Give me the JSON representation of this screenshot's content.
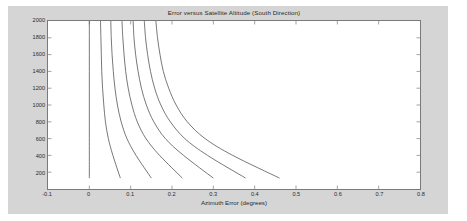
{
  "figure": {
    "background_color": "#d5d5d5",
    "axes_background_color": "#ffffff",
    "axes_border_color": "#7a7a7a",
    "line_color": "#555555"
  },
  "chart_data": {
    "type": "line",
    "title": "Error versus Satellite Altitude (South Direction)",
    "xlabel": "Azimuth Error (degrees)",
    "ylabel": "Satellite Altitude (km)",
    "xlim": [
      -0.1,
      0.8
    ],
    "ylim": [
      0,
      2000
    ],
    "xticks": [
      -0.1,
      0,
      0.1,
      0.2,
      0.3,
      0.4,
      0.5,
      0.6,
      0.7,
      0.8
    ],
    "xtick_labels": [
      "-0.1",
      "0",
      "0.1",
      "0.2",
      "0.3",
      "0.4",
      "0.5",
      "0.6",
      "0.7",
      "0.8"
    ],
    "yticks": [
      200,
      400,
      600,
      800,
      1000,
      1200,
      1400,
      1600,
      1800,
      2000
    ],
    "ytick_labels": [
      "200",
      "400",
      "600",
      "800",
      "1000",
      "1200",
      "1400",
      "1600",
      "1800",
      "2000"
    ],
    "grid": false,
    "legend": null,
    "series": [
      {
        "name": "curve-1",
        "x": [
          0.0,
          0.0,
          0.0,
          0.0,
          0.0,
          0.0,
          0.0,
          0.0,
          0.0,
          0.0
        ],
        "y": [
          2000,
          1800,
          1600,
          1400,
          1200,
          1000,
          800,
          600,
          400,
          130
        ]
      },
      {
        "name": "curve-2",
        "x": [
          0.027,
          0.028,
          0.029,
          0.03,
          0.032,
          0.035,
          0.039,
          0.046,
          0.057,
          0.075
        ],
        "y": [
          2000,
          1800,
          1600,
          1400,
          1200,
          1000,
          800,
          600,
          400,
          130
        ]
      },
      {
        "name": "curve-3",
        "x": [
          0.052,
          0.053,
          0.055,
          0.058,
          0.062,
          0.068,
          0.077,
          0.091,
          0.113,
          0.15
        ],
        "y": [
          2000,
          1800,
          1600,
          1400,
          1200,
          1000,
          800,
          600,
          400,
          130
        ]
      },
      {
        "name": "curve-4",
        "x": [
          0.079,
          0.081,
          0.084,
          0.088,
          0.094,
          0.103,
          0.116,
          0.137,
          0.17,
          0.225
        ],
        "y": [
          2000,
          1800,
          1600,
          1400,
          1200,
          1000,
          800,
          600,
          400,
          130
        ]
      },
      {
        "name": "curve-5",
        "x": [
          0.106,
          0.108,
          0.112,
          0.118,
          0.126,
          0.138,
          0.156,
          0.184,
          0.228,
          0.3
        ],
        "y": [
          2000,
          1800,
          1600,
          1400,
          1200,
          1000,
          800,
          600,
          400,
          130
        ]
      },
      {
        "name": "curve-6",
        "x": [
          0.133,
          0.136,
          0.141,
          0.148,
          0.158,
          0.173,
          0.196,
          0.231,
          0.286,
          0.378
        ],
        "y": [
          2000,
          1800,
          1600,
          1400,
          1200,
          1000,
          800,
          600,
          400,
          130
        ]
      },
      {
        "name": "curve-7",
        "x": [
          0.161,
          0.165,
          0.171,
          0.179,
          0.192,
          0.21,
          0.237,
          0.28,
          0.347,
          0.46
        ],
        "y": [
          2000,
          1800,
          1600,
          1400,
          1200,
          1000,
          800,
          600,
          400,
          130
        ]
      }
    ]
  }
}
